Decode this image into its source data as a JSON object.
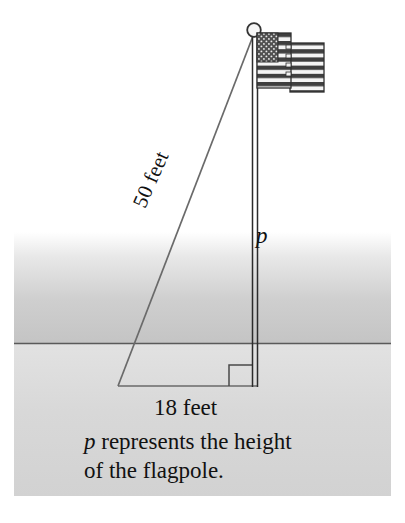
{
  "figure": {
    "type": "geometry-diagram",
    "labels": {
      "hypotenuse": "50 feet",
      "vertical_leg": "p",
      "horizontal_leg": "18 feet"
    },
    "caption": {
      "variable": "p",
      "line1_rest": " represents the height",
      "line2": "of the flagpole."
    },
    "icons": {
      "flag": "american-flag-icon",
      "finial": "pole-finial-icon",
      "right_angle": "right-angle-marker-icon"
    },
    "colors": {
      "line": "#4a4a4a",
      "pole": "#2b2b2b",
      "text": "#111111",
      "sky_band": "#c9c9c9",
      "ground_band": "#d6d6d6",
      "horizon": "#5a5a5a",
      "flag_canton": "#4d4d4d",
      "flag_stripe": "#3c3c3c",
      "flag_field": "#f2f2f2",
      "page": "#ffffff"
    },
    "geometry": {
      "apex": [
        253,
        36
      ],
      "base_left": [
        118,
        386
      ],
      "base_right": [
        255,
        386
      ],
      "horizon_y": 343,
      "sky_top_y": 232,
      "ground_bottom_y": 496,
      "band_left_x": 14,
      "band_right_x": 391
    }
  }
}
